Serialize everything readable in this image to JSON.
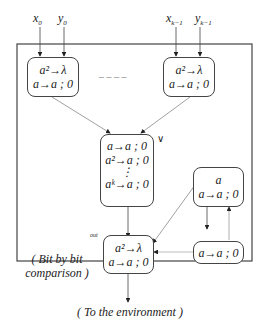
{
  "inputs": {
    "x0": "x",
    "x0_sub": "0",
    "y0": "y",
    "y0_sub": "0",
    "xk": "x",
    "xk_sub": "k−1",
    "yk": "y",
    "yk_sub": "k−1"
  },
  "membranes": {
    "input0": {
      "rules": [
        "a²→λ",
        "a→a ; 0"
      ]
    },
    "ellipsis": "– – – –",
    "inputk": {
      "rules": [
        "a²→λ",
        "a→a ; 0"
      ]
    },
    "or_neuron": {
      "label": "∨",
      "rules": [
        "a→a ; 0",
        "a²→a ; 0",
        "⋮",
        "aᵏ→a ; 0"
      ]
    },
    "self_loop_top": {
      "rules": [
        "a",
        "a→a ; 0"
      ]
    },
    "self_loop_bottom": {
      "rules": [
        "a→a ; 0"
      ]
    },
    "out_neuron": {
      "label": "out",
      "rules": [
        "a²→λ",
        "a→a ; 0"
      ]
    }
  },
  "annotations": {
    "comparison": [
      "( Bit by bit",
      "comparison )"
    ],
    "environment": "( To the environment )"
  }
}
